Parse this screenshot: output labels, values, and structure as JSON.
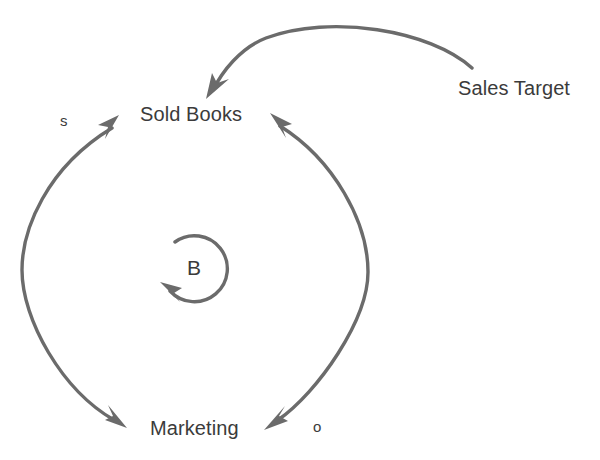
{
  "diagram": {
    "type": "causal-loop-diagram",
    "background_color": "#ffffff",
    "stroke_color": "#6b6b6b",
    "text_color": "#3b3b3b",
    "nodes": [
      {
        "id": "sold-books",
        "label": "Sold Books",
        "x": 202,
        "y": 115
      },
      {
        "id": "marketing",
        "label": "Marketing",
        "x": 196,
        "y": 429
      },
      {
        "id": "sales-target",
        "label": "Sales Target",
        "x": 520,
        "y": 88
      }
    ],
    "loop_markers": [
      {
        "id": "balancing-loop",
        "label": "B",
        "x": 196,
        "y": 268,
        "radius": 33,
        "direction": "counterclockwise"
      }
    ],
    "polarity_markers": [
      {
        "id": "polarity-s",
        "label": "s",
        "x": 65,
        "y": 121,
        "meaning": "same"
      },
      {
        "id": "polarity-o",
        "label": "o",
        "x": 318,
        "y": 427,
        "meaning": "opposite"
      }
    ],
    "links": [
      {
        "id": "sold-books-to-marketing",
        "from": "Sold Books",
        "to": "Marketing",
        "polarity": "o",
        "side": "right",
        "arrowheads": "both"
      },
      {
        "id": "marketing-to-sold-books",
        "from": "Marketing",
        "to": "Sold Books",
        "polarity": "s",
        "side": "left",
        "arrowheads": "both"
      },
      {
        "id": "sales-target-to-sold-books",
        "from": "Sales Target",
        "to": "Sold Books",
        "polarity": "",
        "side": "top",
        "arrowheads": "end"
      }
    ]
  }
}
